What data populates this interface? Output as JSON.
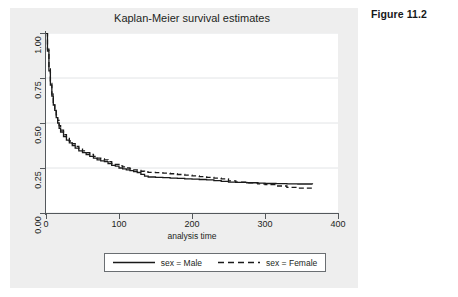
{
  "figure": {
    "caption": "Figure 11.2"
  },
  "chart": {
    "title": "Kaplan-Meier survival estimates",
    "xlabel": "analysis time",
    "colors": {
      "male_line": "#1a1a1a",
      "female_line": "#1a1a1a",
      "axis": "#54585c",
      "grid": "#e2e4e6",
      "canvas": "#eeeeee",
      "plot_bg": "#ffffff"
    }
  },
  "axes": {
    "y_ticks": [
      "0.00",
      "0.25",
      "0.50",
      "0.75",
      "1.00"
    ],
    "x_ticks": [
      "0",
      "100",
      "200",
      "300",
      "400"
    ]
  },
  "legend": {
    "entries": [
      {
        "label": "sex = Male",
        "style": "solid"
      },
      {
        "label": "sex = Female",
        "style": "dashed"
      }
    ]
  },
  "chart_data": {
    "type": "line",
    "title": "Kaplan-Meier survival estimates",
    "subtitle": "",
    "xlabel": "analysis time",
    "ylabel": "",
    "xlim": [
      0,
      400
    ],
    "ylim": [
      0.0,
      1.0
    ],
    "xticks": [
      0,
      100,
      200,
      300,
      400
    ],
    "yticks": [
      0.0,
      0.25,
      0.5,
      0.75,
      1.0
    ],
    "grid": "horizontal",
    "legend_position": "bottom",
    "annotations": [
      "Figure 11.2"
    ],
    "series": [
      {
        "name": "sex = Male",
        "style": "solid",
        "step": true,
        "x": [
          0,
          2,
          4,
          6,
          8,
          10,
          12,
          14,
          16,
          18,
          20,
          24,
          28,
          32,
          36,
          40,
          45,
          50,
          55,
          60,
          65,
          70,
          75,
          80,
          85,
          90,
          95,
          100,
          105,
          110,
          115,
          120,
          125,
          130,
          135,
          140,
          150,
          160,
          170,
          180,
          190,
          200,
          210,
          220,
          230,
          240,
          250,
          260,
          275,
          290,
          300,
          315,
          330,
          345,
          365
        ],
        "y": [
          1.0,
          0.9,
          0.79,
          0.71,
          0.65,
          0.6,
          0.57,
          0.53,
          0.5,
          0.47,
          0.45,
          0.425,
          0.405,
          0.39,
          0.375,
          0.36,
          0.345,
          0.335,
          0.325,
          0.315,
          0.305,
          0.295,
          0.29,
          0.285,
          0.275,
          0.265,
          0.26,
          0.25,
          0.245,
          0.24,
          0.235,
          0.23,
          0.225,
          0.215,
          0.205,
          0.2,
          0.198,
          0.196,
          0.194,
          0.192,
          0.19,
          0.188,
          0.186,
          0.184,
          0.18,
          0.176,
          0.172,
          0.17,
          0.168,
          0.166,
          0.164,
          0.163,
          0.162,
          0.161,
          0.16
        ]
      },
      {
        "name": "sex = Female",
        "style": "dashed",
        "step": true,
        "x": [
          0,
          2,
          4,
          6,
          8,
          10,
          12,
          14,
          16,
          18,
          20,
          24,
          28,
          32,
          36,
          40,
          45,
          50,
          55,
          60,
          65,
          70,
          75,
          80,
          85,
          90,
          95,
          100,
          105,
          110,
          115,
          120,
          125,
          130,
          135,
          140,
          150,
          160,
          170,
          180,
          190,
          200,
          210,
          220,
          230,
          240,
          250,
          260,
          275,
          290,
          300,
          315,
          330,
          345,
          365
        ],
        "y": [
          1.0,
          0.91,
          0.8,
          0.72,
          0.66,
          0.615,
          0.58,
          0.545,
          0.515,
          0.485,
          0.46,
          0.435,
          0.415,
          0.4,
          0.385,
          0.37,
          0.355,
          0.345,
          0.335,
          0.325,
          0.315,
          0.305,
          0.3,
          0.295,
          0.285,
          0.275,
          0.27,
          0.262,
          0.256,
          0.25,
          0.245,
          0.24,
          0.236,
          0.232,
          0.228,
          0.226,
          0.224,
          0.222,
          0.218,
          0.214,
          0.21,
          0.206,
          0.202,
          0.198,
          0.194,
          0.19,
          0.178,
          0.172,
          0.168,
          0.162,
          0.158,
          0.15,
          0.142,
          0.138,
          0.135
        ]
      }
    ]
  }
}
